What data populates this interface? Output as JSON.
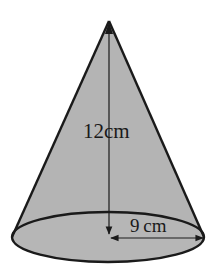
{
  "diagram": {
    "shape": "cone",
    "fill_color": "#b4b4b4",
    "stroke_color": "#1a1a1a",
    "background": "#ffffff",
    "labels": {
      "height": "12cm",
      "radius": "9 cm"
    },
    "measurements": {
      "height_value": 12,
      "radius_value": 9,
      "unit": "cm"
    }
  }
}
